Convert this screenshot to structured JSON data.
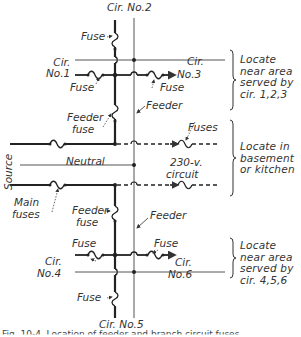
{
  "diagram": {
    "title_hidden": "Feeder and branch circuit layout",
    "circuits": {
      "c1": "Cir.\nNo.1",
      "c2": "Cir. No.2",
      "c3_a": "Cir.",
      "c3_b": "No.3",
      "c4_a": "Cir.",
      "c4_b": "No.4",
      "c5": "Cir. No.5",
      "c6_a": "Cir.",
      "c6_b": "No.6"
    },
    "labels": {
      "fuse_c2": "Fuse",
      "fuse_c1": "Fuse",
      "fuse_c3": "Fuse",
      "feeder_top": "Feeder",
      "feeder_fuse_top_a": "Feeder",
      "feeder_fuse_top_b": "fuse",
      "fuses_230": "Fuses",
      "source": "Source",
      "neutral": "Neutral",
      "circuit_230_a": "230-v.",
      "circuit_230_b": "circuit",
      "main_fuses_a": "Main",
      "main_fuses_b": "fuses",
      "feeder_fuse_bottom_a": "Feeder",
      "feeder_fuse_bottom_b": "fuse",
      "feeder_bottom": "Feeder",
      "fuse_c4": "Fuse",
      "fuse_c6": "Fuse",
      "fuse_c5": "Fuse"
    },
    "notes": [
      {
        "text": "Locate\nnear area\nserved by\ncir. 1,2,3"
      },
      {
        "text": "Locate in\nbasement\nor kitchen"
      },
      {
        "text": "Locate\nnear area\nserved by\ncir. 4,5,6"
      }
    ],
    "caption": "Fig. 10-4. Location of feeder and branch circuit fuses"
  },
  "colors": {
    "line": "#222222",
    "thin_line": "#555555",
    "background": "#ffffff"
  }
}
